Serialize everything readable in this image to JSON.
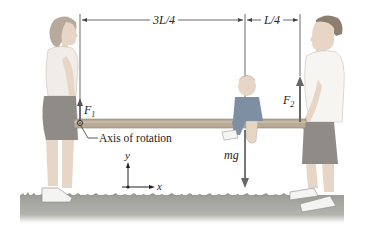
{
  "figure": {
    "dimensions": {
      "left_segment": "3L/4",
      "right_segment": "L/4"
    },
    "forces": {
      "left": {
        "symbol": "F",
        "subscript": "1"
      },
      "right": {
        "symbol": "F",
        "subscript": "2"
      },
      "weight": "mg"
    },
    "annotations": {
      "axis_label": "Axis of rotation"
    },
    "axes": {
      "y_label": "y",
      "x_label": "x"
    },
    "colors": {
      "plank": "#b9aa96",
      "plank_edge": "#8a7c6a",
      "grass": "#9a9a94",
      "force_arrow": "#6b6b6b",
      "dimension_line": "#444444",
      "skin": "#e7d6c6",
      "shirt_left": "#f1ece8",
      "shorts": "#8f8c88",
      "shirt_child": "#7f8fa3"
    }
  }
}
